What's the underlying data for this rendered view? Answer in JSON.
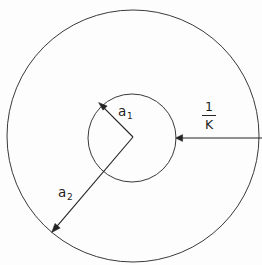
{
  "figure": {
    "type": "geometry-diagram",
    "background_color": "#fdfdfd",
    "line_color": "#262626",
    "width": 262,
    "height": 265
  },
  "labels": {
    "a1": {
      "base": "a",
      "sub": "1"
    },
    "a2": {
      "base": "a",
      "sub": "2"
    },
    "one_over_k": {
      "numerator": "1",
      "denominator": "K"
    }
  },
  "shapes": {
    "inner_circle": {
      "name": "inner-circle",
      "cx": 132,
      "cy": 138,
      "r": 44
    },
    "outer_circle": {
      "name": "outer-circle",
      "cx": 133,
      "cy": 136,
      "r": 126
    }
  },
  "annotations": {
    "a1_arrow": {
      "name": "radius-arrow-a1",
      "from_x": 133,
      "from_y": 137,
      "to_x": 99,
      "to_y": 103,
      "points_to": "inner-circle"
    },
    "a2_arrow": {
      "name": "radius-arrow-a2",
      "from_x": 133,
      "from_y": 137,
      "to_x": 52,
      "to_y": 232,
      "points_to": "outer-circle"
    },
    "gap_arrow": {
      "name": "gap-arrow-one-over-k",
      "from_x": 262,
      "from_y": 138,
      "to_x": 176,
      "to_y": 138,
      "points_to": "inner-circle"
    }
  }
}
